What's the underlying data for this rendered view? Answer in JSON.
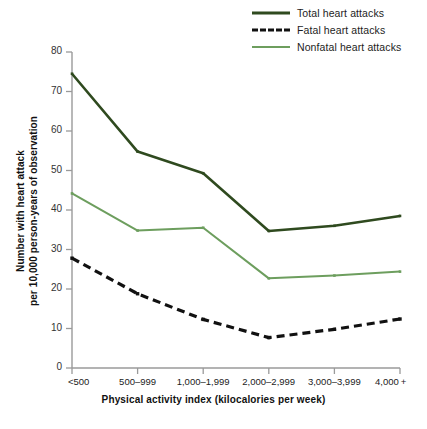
{
  "chart_data": {
    "type": "line",
    "title": "",
    "xlabel": "Physical activity index (kilocalories per week)",
    "ylabel": "Number with heart attack per 10,000 person-years of observation",
    "ylabel_line1": "Number with heart attack",
    "ylabel_line2": "per 10,000 person-years of observation",
    "categories": [
      "<500",
      "500–999",
      "1,000–1,999",
      "2,000–2,999",
      "3,000–3,999",
      "4,000 +"
    ],
    "ylim": [
      0,
      80
    ],
    "yticks": [
      0,
      10,
      20,
      30,
      40,
      50,
      60,
      70,
      80
    ],
    "ytick_labels": [
      "0",
      "10",
      "20",
      "30",
      "40",
      "50",
      "60",
      "70",
      "80"
    ],
    "grid": false,
    "legend_position": "top-right",
    "series": [
      {
        "name": "Total heart attacks",
        "values": [
          74.5,
          54.8,
          49.3,
          34.7,
          36.0,
          38.5
        ],
        "color": "#2f4a1f",
        "style": "solid",
        "marker": "square"
      },
      {
        "name": "Fatal heart attacks",
        "values": [
          27.8,
          18.8,
          12.3,
          7.7,
          9.8,
          12.4
        ],
        "color": "#111111",
        "style": "dashed",
        "marker": "square"
      },
      {
        "name": "Nonfatal heart attacks",
        "values": [
          44.2,
          34.8,
          35.5,
          22.7,
          23.4,
          24.4
        ],
        "color": "#6d9e5e",
        "style": "solid",
        "marker": "square"
      }
    ]
  },
  "legend": {
    "items": [
      {
        "label": "Total heart attacks",
        "swatch": "solid-dark-green-line"
      },
      {
        "label": "Fatal heart attacks",
        "swatch": "dashed-black-line"
      },
      {
        "label": "Nonfatal heart attacks",
        "swatch": "solid-light-green-line"
      }
    ]
  },
  "axes": {
    "x_title": "Physical activity index (kilocalories per week)",
    "y_title_line1": "Number with heart attack",
    "y_title_line2": "per 10,000 person-years of observation",
    "x_tick_labels": [
      "<500",
      "500–999",
      "1,000–1,999",
      "2,000–2,999",
      "3,000–3,999",
      "4,000 +"
    ],
    "y_tick_labels": [
      "80",
      "70",
      "60",
      "50",
      "40",
      "30",
      "20",
      "10",
      "0"
    ]
  },
  "caption": {
    "text": ""
  },
  "colors": {
    "total": "#2f4a1f",
    "fatal": "#111111",
    "nonfatal": "#6d9e5e",
    "axis": "#9a9a9a",
    "background": "#ffffff"
  }
}
